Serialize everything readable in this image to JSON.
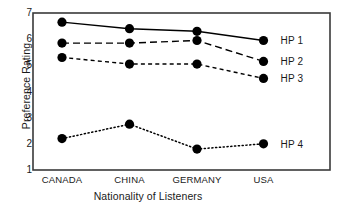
{
  "chart_data": {
    "type": "line",
    "title": "",
    "xlabel": "Nationality of Listeners",
    "ylabel": "Preference Rating",
    "categories": [
      "CANADA",
      "CHINA",
      "GERMANY",
      "USA"
    ],
    "ylim": [
      1,
      7
    ],
    "yticks": [
      1,
      2,
      3,
      4,
      5,
      6,
      7
    ],
    "ytick_labels": [
      "1",
      "2",
      "3",
      "4",
      "5",
      "6",
      "7"
    ],
    "grid": false,
    "legend_position": "right-inside",
    "series": [
      {
        "name": "HP 1",
        "values": [
          6.65,
          6.4,
          6.3,
          5.95
        ],
        "linestyle": "solid",
        "color": "#000000",
        "marker": "circle"
      },
      {
        "name": "HP 2",
        "values": [
          5.85,
          5.85,
          5.95,
          5.15
        ],
        "linestyle": "long-dash",
        "color": "#000000",
        "marker": "circle"
      },
      {
        "name": "HP 3",
        "values": [
          5.3,
          5.05,
          5.05,
          4.5
        ],
        "linestyle": "short-dash",
        "color": "#000000",
        "marker": "circle"
      },
      {
        "name": "HP 4",
        "values": [
          2.2,
          2.75,
          1.8,
          2.0
        ],
        "linestyle": "dotted",
        "color": "#000000",
        "marker": "circle"
      }
    ]
  },
  "legend": {
    "items": [
      "HP 1",
      "HP 2",
      "HP 3",
      "HP 4"
    ]
  },
  "axes": {
    "frame_color": "#3a3a3a",
    "text_color": "#1a1a1a"
  }
}
